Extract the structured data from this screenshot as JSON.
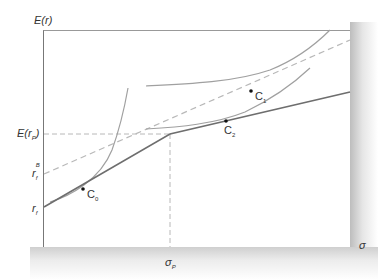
{
  "diagram": {
    "y_axis_label": "E(r)",
    "x_axis_label": "σ",
    "labels": {
      "e_rp": {
        "main": "E(r",
        "sub": "P",
        "close": ")"
      },
      "rf_b": {
        "main": "r",
        "sub": "f",
        "sup": "B"
      },
      "rf": {
        "main": "r",
        "sub": "f"
      },
      "sigma_p": {
        "main": "σ",
        "sub": "P"
      },
      "c0": {
        "main": "C",
        "sub": "0"
      },
      "c1": {
        "main": "C",
        "sub": "1"
      },
      "c2": {
        "main": "C",
        "sub": "2"
      }
    },
    "colors": {
      "solid_line": "#6e6e6e",
      "curves": "#a0a0a0",
      "dashed": "#b8b8b8",
      "axis": "#777777"
    }
  }
}
